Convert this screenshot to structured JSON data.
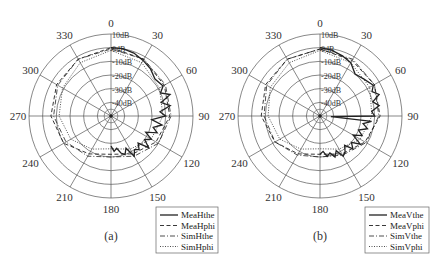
{
  "chart_data": [
    {
      "type": "polar-line",
      "caption": "(a)",
      "center": [
        111,
        116
      ],
      "radius": 82,
      "r_range_db": [
        -50,
        10
      ],
      "ring_labels": [
        "10dB",
        "0dB",
        "-10dB",
        "-20dB",
        "-30dB",
        "-40dB"
      ],
      "angle_labels": [
        "0",
        "30",
        "60",
        "90",
        "120",
        "150",
        "180",
        "210",
        "240",
        "270",
        "300",
        "330"
      ],
      "legend": [
        "MeaHthe",
        "MeaHphi",
        "SimHthe",
        "SimHphi"
      ],
      "series": [
        {
          "name": "MeaHthe",
          "style": "solid",
          "angles": [
            0,
            10,
            20,
            30,
            40,
            50,
            60,
            65,
            70,
            75,
            80,
            85,
            90,
            95,
            100,
            105,
            110,
            115,
            120,
            125,
            130,
            135,
            140,
            145,
            150,
            155,
            160,
            165,
            170,
            175,
            180
          ],
          "values_db": [
            0,
            0,
            -1,
            -3,
            -5,
            -8,
            -6,
            -10,
            -4,
            -12,
            -6,
            -14,
            -10,
            -20,
            -12,
            -18,
            -14,
            -22,
            -16,
            -20,
            -14,
            -22,
            -18,
            -20,
            -16,
            -24,
            -20,
            -22,
            -26,
            -24,
            -28
          ]
        },
        {
          "name": "MeaHphi",
          "style": "dashed",
          "angles": [
            0,
            30,
            60,
            90,
            120,
            150,
            180,
            210,
            240,
            270,
            300,
            330,
            360
          ],
          "values_db": [
            0,
            -2,
            -5,
            -7,
            -12,
            -18,
            -22,
            -18,
            -10,
            -6,
            -4,
            -2,
            0
          ]
        },
        {
          "name": "SimHthe",
          "style": "dashdot",
          "angles": [
            0,
            30,
            60,
            90,
            120,
            150,
            180,
            210,
            240,
            270,
            300,
            330,
            360
          ],
          "values_db": [
            -1,
            -2,
            -4,
            -6,
            -10,
            -16,
            -20,
            -16,
            -12,
            -8,
            -5,
            -2,
            -1
          ]
        },
        {
          "name": "SimHphi",
          "style": "dotted",
          "angles": [
            0,
            30,
            60,
            90,
            120,
            150,
            180,
            210,
            240,
            270,
            300,
            330,
            360
          ],
          "values_db": [
            -2,
            -5,
            -9,
            -12,
            -16,
            -22,
            -26,
            -22,
            -16,
            -12,
            -9,
            -5,
            -2
          ]
        }
      ]
    },
    {
      "type": "polar-line",
      "caption": "(b)",
      "center": [
        320,
        116
      ],
      "radius": 82,
      "r_range_db": [
        -50,
        10
      ],
      "ring_labels": [
        "10dB",
        "0dB",
        "-10dB",
        "-20dB",
        "-30dB",
        "-40dB"
      ],
      "angle_labels": [
        "0",
        "30",
        "60",
        "90",
        "120",
        "150",
        "180",
        "210",
        "240",
        "270",
        "300",
        "330"
      ],
      "legend": [
        "MeaVthe",
        "MeaVphi",
        "SimVthe",
        "SimVphi"
      ],
      "series": [
        {
          "name": "MeaVthe",
          "style": "solid",
          "angles": [
            0,
            10,
            20,
            30,
            40,
            50,
            60,
            65,
            70,
            75,
            80,
            85,
            90,
            93,
            96,
            100,
            105,
            110,
            115,
            120,
            125,
            130,
            135,
            140,
            145,
            150,
            155,
            160,
            165,
            170,
            175,
            180
          ],
          "values_db": [
            0,
            -1,
            -3,
            -5,
            -10,
            -8,
            -5,
            -8,
            -4,
            -10,
            -6,
            -12,
            -10,
            -42,
            -12,
            -18,
            -14,
            -20,
            -16,
            -22,
            -14,
            -20,
            -16,
            -22,
            -18,
            -16,
            -22,
            -18,
            -22,
            -20,
            -24,
            -22
          ]
        },
        {
          "name": "MeaVphi",
          "style": "dashed",
          "angles": [
            0,
            30,
            60,
            90,
            120,
            150,
            180,
            210,
            240,
            270,
            300,
            330,
            360
          ],
          "values_db": [
            -1,
            -3,
            -4,
            -6,
            -12,
            -18,
            -22,
            -18,
            -12,
            -7,
            -4,
            -2,
            -1
          ]
        },
        {
          "name": "SimVthe",
          "style": "dashdot",
          "angles": [
            0,
            30,
            60,
            90,
            120,
            150,
            180,
            210,
            240,
            270,
            300,
            330,
            360
          ],
          "values_db": [
            -1,
            -2,
            -4,
            -7,
            -11,
            -17,
            -20,
            -17,
            -12,
            -9,
            -5,
            -2,
            -1
          ]
        },
        {
          "name": "SimVphi",
          "style": "dotted",
          "angles": [
            0,
            30,
            60,
            90,
            120,
            150,
            180,
            210,
            240,
            270,
            300,
            330,
            360
          ],
          "values_db": [
            -2,
            -5,
            -8,
            -12,
            -16,
            -22,
            -26,
            -22,
            -16,
            -12,
            -8,
            -5,
            -2
          ]
        }
      ]
    }
  ]
}
